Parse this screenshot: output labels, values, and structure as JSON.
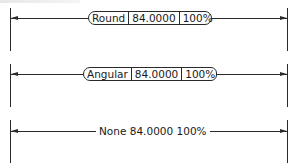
{
  "figure": {
    "rows": [
      {
        "style": "Round",
        "label": "Round",
        "value": "84.0000",
        "scale": "100%"
      },
      {
        "style": "Angular",
        "label": "Angular",
        "value": "84.0000",
        "scale": "100%"
      },
      {
        "style": "None",
        "label": "None",
        "value": "84.0000",
        "scale": "100%"
      }
    ]
  },
  "colors": {
    "line": "#2a2a2a",
    "background": "#ffffff"
  }
}
